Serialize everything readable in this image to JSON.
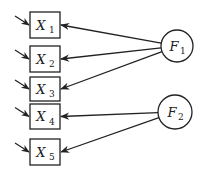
{
  "diagram": {
    "type": "factor-analysis-path-diagram",
    "observed": [
      {
        "id": "X1",
        "base": "X",
        "sub": "1",
        "x": 30,
        "y": 12,
        "w": 30,
        "h": 26
      },
      {
        "id": "X2",
        "base": "X",
        "sub": "2",
        "x": 30,
        "y": 46,
        "w": 30,
        "h": 26
      },
      {
        "id": "X3",
        "base": "X",
        "sub": "3",
        "x": 30,
        "y": 77,
        "w": 30,
        "h": 24
      },
      {
        "id": "X4",
        "base": "X",
        "sub": "4",
        "x": 30,
        "y": 104,
        "w": 30,
        "h": 25
      },
      {
        "id": "X5",
        "base": "X",
        "sub": "5",
        "x": 30,
        "y": 139,
        "w": 30,
        "h": 26
      }
    ],
    "latent": [
      {
        "id": "F1",
        "base": "F",
        "sub": "1",
        "cx": 177,
        "cy": 46,
        "r": 16
      },
      {
        "id": "F2",
        "base": "F",
        "sub": "2",
        "cx": 175,
        "cy": 112,
        "r": 17
      }
    ],
    "loadings": [
      {
        "from": "F1",
        "to": "X1"
      },
      {
        "from": "F1",
        "to": "X2"
      },
      {
        "from": "F1",
        "to": "X3"
      },
      {
        "from": "F2",
        "to": "X4"
      },
      {
        "from": "F2",
        "to": "X5"
      }
    ],
    "error_arrows": [
      "X1",
      "X2",
      "X3",
      "X4",
      "X5"
    ],
    "stroke_color": "#222222"
  }
}
